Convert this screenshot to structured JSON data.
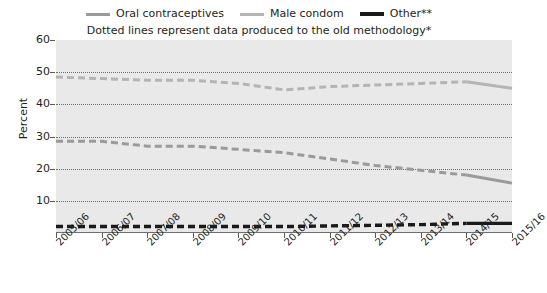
{
  "legend": {
    "entries": [
      {
        "label": "Oral contraceptives",
        "color": "#9a9a9a"
      },
      {
        "label": "Male condom",
        "color": "#b4b4b4"
      },
      {
        "label": "Other**",
        "color": "#1a1a1a"
      }
    ]
  },
  "subtitle": "Dotted lines represent data produced to the old methodology*",
  "axes": {
    "ylabel": "Percent",
    "yticks": [
      "10",
      "20",
      "30",
      "40",
      "50",
      "60"
    ],
    "xticks": [
      "2005/06",
      "2006/07",
      "2007/08",
      "2008/09",
      "2009/10",
      "2010/11",
      "2011/12",
      "2012/13",
      "2013/14",
      "2014/15",
      "2015/16"
    ]
  },
  "chart_data": {
    "type": "line",
    "title": "",
    "subtitle": "Dotted lines represent data produced to the old methodology*",
    "xlabel": "",
    "ylabel": "Percent",
    "ylim": [
      0,
      60
    ],
    "ytick_values": [
      0,
      10,
      20,
      30,
      40,
      50,
      60
    ],
    "grid": true,
    "legend_position": "top-center",
    "categories": [
      "2005/06",
      "2006/07",
      "2007/08",
      "2008/09",
      "2009/10",
      "2010/11",
      "2011/12",
      "2012/13",
      "2013/14",
      "2014/15",
      "2015/16"
    ],
    "series": [
      {
        "name": "Male condom",
        "color": "#b4b4b4",
        "values": [
          48.5,
          48.0,
          47.5,
          47.5,
          46.5,
          44.5,
          45.5,
          46.0,
          46.5,
          47.0,
          45.0
        ],
        "dashed_range": [
          0,
          9
        ],
        "solid_range": [
          9,
          10
        ]
      },
      {
        "name": "Oral contraceptives",
        "color": "#9a9a9a",
        "values": [
          28.5,
          28.5,
          27.0,
          27.0,
          26.0,
          25.0,
          23.0,
          21.0,
          19.5,
          18.0,
          15.5
        ],
        "dashed_range": [
          0,
          9
        ],
        "solid_range": [
          9,
          10
        ]
      },
      {
        "name": "Other**",
        "color": "#1a1a1a",
        "values": [
          2.0,
          2.0,
          2.0,
          2.0,
          2.0,
          2.0,
          2.2,
          2.4,
          2.6,
          3.0,
          3.0
        ],
        "dashed_range": [
          0,
          9
        ],
        "solid_range": [
          9,
          10
        ]
      }
    ]
  },
  "colors": {
    "plot_background": "#e9e9e9",
    "axis": "#6d6e71",
    "text": "#231f20"
  }
}
